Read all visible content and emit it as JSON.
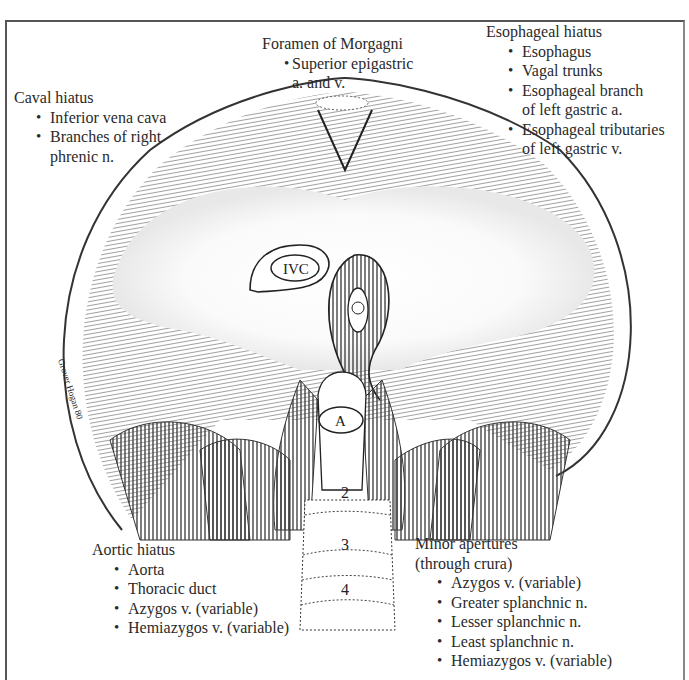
{
  "figure": {
    "signature": "Grover Hogan 80",
    "structure_labels": {
      "ivc": "IVC",
      "aorta": "A",
      "vertebra_2": "2",
      "vertebra_3": "3",
      "vertebra_4": "4"
    }
  },
  "labels": {
    "caval_hiatus": {
      "title": "Caval hiatus",
      "items": [
        "Inferior vena cava",
        "Branches of right",
        "phrenic n."
      ]
    },
    "foramen_morgagni": {
      "title": "Foramen of Morgagni",
      "items": [
        "Superior epigastric",
        "a. and v."
      ]
    },
    "esophageal_hiatus": {
      "title": "Esophageal hiatus",
      "items": [
        "Esophagus",
        "Vagal trunks",
        "Esophageal branch",
        "of left gastric a.",
        "Esophageal tributaries",
        "of left gastric v."
      ]
    },
    "aortic_hiatus": {
      "title": "Aortic hiatus",
      "items": [
        "Aorta",
        "Thoracic duct",
        "Azygos v. (variable)",
        "Hemiazygos v. (variable)"
      ]
    },
    "minor_apertures": {
      "title": "Minor apertures",
      "subtitle": "(through crura)",
      "items": [
        "Azygos v. (variable)",
        "Greater splanchnic n.",
        "Lesser splanchnic n.",
        "Least splanchnic n.",
        "Hemiazygos v. (variable)"
      ]
    }
  }
}
